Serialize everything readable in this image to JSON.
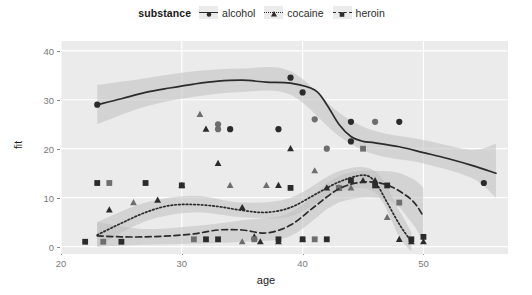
{
  "legend": {
    "title": "substance",
    "items": [
      {
        "label": "alcohol",
        "linetype": "solid",
        "shape": "circle",
        "color": "#2b2b2b",
        "key_name": "legend-key-alcohol"
      },
      {
        "label": "cocaine",
        "linetype": "dotted",
        "shape": "triangle",
        "color": "#2b2b2b",
        "key_name": "legend-key-cocaine"
      },
      {
        "label": "heroin",
        "linetype": "dashed",
        "shape": "square",
        "color": "#2b2b2b",
        "key_name": "legend-key-heroin"
      }
    ]
  },
  "axes": {
    "x_title": "age",
    "y_title": "fit",
    "x_ticks": [
      "20",
      "30",
      "40",
      "50"
    ],
    "y_ticks": [
      "0",
      "10",
      "20",
      "30",
      "40"
    ]
  },
  "colors": {
    "panel_background": "#ebebeb",
    "gridline": "#ffffff",
    "ribbon": "#bfbfbf",
    "line": "#2b2b2b",
    "tick_label": "#7a7a7a",
    "axis_title": "#1a1a1a",
    "point_dark": "#2b2b2b",
    "point_mid": "#6e6e6e"
  },
  "chart_data": {
    "type": "line",
    "title": "",
    "xlabel": "age",
    "ylabel": "fit",
    "xlim": [
      20,
      57
    ],
    "ylim": [
      -1.5,
      42
    ],
    "grid": true,
    "legend_position": "top",
    "legend_title": "substance",
    "x_ticks": [
      20,
      30,
      40,
      50
    ],
    "y_ticks": [
      0,
      10,
      20,
      30,
      40
    ],
    "series": [
      {
        "name": "alcohol",
        "linetype": "solid",
        "shape": "circle",
        "color": "#2b2b2b",
        "fit": {
          "x": [
            23,
            25,
            27,
            29,
            31,
            33,
            35,
            37,
            39,
            41,
            42,
            43,
            44,
            45,
            46,
            48,
            50,
            52,
            54,
            56
          ],
          "y": [
            29.0,
            30.2,
            31.5,
            32.4,
            33.2,
            33.8,
            34.0,
            33.6,
            33.4,
            32.0,
            29.0,
            25.0,
            22.5,
            21.5,
            21.2,
            20.4,
            19.2,
            18.0,
            16.6,
            15.0
          ]
        },
        "ribbon": {
          "x": [
            23,
            27,
            31,
            35,
            39,
            43,
            46,
            50,
            54,
            56
          ],
          "lower": [
            25.0,
            28.6,
            30.6,
            31.6,
            31.0,
            22.6,
            18.8,
            17.0,
            14.0,
            10.0
          ],
          "upper": [
            33.0,
            34.4,
            35.8,
            36.4,
            35.8,
            27.4,
            23.6,
            21.8,
            19.8,
            21.0
          ]
        },
        "points": [
          [
            23,
            29
          ],
          [
            33,
            24
          ],
          [
            39,
            34.5
          ],
          [
            40,
            31.5
          ],
          [
            41,
            26
          ],
          [
            44,
            21.5
          ],
          [
            44,
            25.5
          ],
          [
            46,
            25.5
          ],
          [
            48,
            25.5
          ],
          [
            55,
            13
          ],
          [
            33,
            25
          ],
          [
            34,
            24
          ],
          [
            38,
            24
          ],
          [
            42,
            20
          ]
        ]
      },
      {
        "name": "cocaine",
        "linetype": "dotted",
        "shape": "triangle",
        "color": "#2b2b2b",
        "fit": {
          "x": [
            23,
            25,
            27,
            29,
            31,
            33,
            35,
            37,
            39,
            41,
            43,
            45,
            46,
            47,
            48,
            49
          ],
          "y": [
            2.4,
            4.8,
            7.0,
            8.4,
            8.6,
            8.2,
            7.4,
            7.0,
            8.0,
            10.6,
            13.2,
            14.6,
            13.2,
            9.0,
            4.6,
            1.0
          ]
        },
        "ribbon": {
          "x": [
            23,
            27,
            31,
            35,
            39,
            43,
            46,
            48,
            49
          ],
          "lower": [
            0.0,
            5.2,
            7.0,
            6.0,
            6.2,
            11.2,
            11.0,
            2.0,
            -1.0
          ],
          "upper": [
            5.0,
            9.0,
            10.4,
            9.0,
            10.0,
            15.4,
            15.4,
            7.4,
            3.0
          ]
        },
        "points": [
          [
            24,
            7.5
          ],
          [
            26,
            9
          ],
          [
            28,
            9.5
          ],
          [
            30,
            12.5
          ],
          [
            31.5,
            27
          ],
          [
            32,
            24
          ],
          [
            33,
            17
          ],
          [
            34,
            12.5
          ],
          [
            35,
            8
          ],
          [
            36,
            2
          ],
          [
            37,
            12.5
          ],
          [
            38,
            12.5
          ],
          [
            39,
            20
          ],
          [
            41,
            15.5
          ],
          [
            42,
            12
          ],
          [
            43,
            12
          ],
          [
            44,
            12
          ],
          [
            45,
            13.5
          ],
          [
            46,
            13.5
          ],
          [
            47,
            6
          ],
          [
            48,
            1.5
          ],
          [
            49,
            1
          ],
          [
            35,
            1
          ],
          [
            36.5,
            1
          ],
          [
            38,
            1
          ],
          [
            40,
            1.5
          ],
          [
            50,
            1
          ]
        ]
      },
      {
        "name": "heroin",
        "linetype": "dashed",
        "shape": "square",
        "color": "#2b2b2b",
        "fit": {
          "x": [
            23,
            25,
            27,
            29,
            31,
            33,
            35,
            37,
            39,
            41,
            43,
            45,
            47,
            49,
            50
          ],
          "y": [
            2.2,
            2.0,
            2.0,
            2.2,
            2.6,
            3.4,
            3.4,
            2.8,
            4.4,
            8.2,
            11.8,
            13.2,
            12.6,
            9.6,
            6.2
          ]
        },
        "ribbon": {
          "x": [
            23,
            27,
            31,
            35,
            39,
            43,
            47,
            49,
            50
          ],
          "lower": [
            0.0,
            0.4,
            0.6,
            1.0,
            2.2,
            9.0,
            9.6,
            5.0,
            1.0
          ],
          "upper": [
            5.0,
            3.6,
            4.2,
            5.4,
            7.0,
            14.4,
            15.4,
            14.0,
            12.0
          ]
        },
        "points": [
          [
            23,
            13
          ],
          [
            24,
            13
          ],
          [
            27,
            13
          ],
          [
            30,
            12.5
          ],
          [
            31,
            1.5
          ],
          [
            32,
            1.5
          ],
          [
            33,
            1.5
          ],
          [
            36,
            1.5
          ],
          [
            38,
            1.5
          ],
          [
            40,
            1.5
          ],
          [
            41,
            1.5
          ],
          [
            42,
            1.5
          ],
          [
            44,
            13.5
          ],
          [
            45,
            20
          ],
          [
            46,
            12.5
          ],
          [
            47,
            12.5
          ],
          [
            48,
            9
          ],
          [
            49,
            1.5
          ],
          [
            39,
            12
          ],
          [
            43,
            12
          ],
          [
            50,
            2
          ],
          [
            22,
            1
          ],
          [
            23.5,
            1
          ],
          [
            25,
            1
          ]
        ]
      }
    ]
  }
}
